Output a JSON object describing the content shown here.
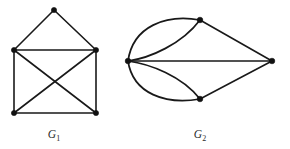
{
  "figure": {
    "background_color": "#ffffff",
    "ink_color": "#191919",
    "vertex_color": "#111111",
    "width": 290,
    "height": 149,
    "caption_color": "#2a2a2a"
  },
  "graphs": [
    {
      "id": "G1",
      "label_base": "G",
      "label_subscript": "1",
      "label_x": 54,
      "label_y": 138,
      "vertex_radius": 2.6,
      "vertex_count": 5,
      "edge_count": 8,
      "vertices": [
        {
          "name": "apex",
          "x": 54,
          "y": 10
        },
        {
          "name": "left",
          "x": 14,
          "y": 50
        },
        {
          "name": "right",
          "x": 96,
          "y": 50
        },
        {
          "name": "bottom-left",
          "x": 14,
          "y": 113
        },
        {
          "name": "bottom-right",
          "x": 96,
          "y": 113
        }
      ],
      "edges": [
        {
          "name": "apex-left",
          "from": "apex",
          "to": "left",
          "path": "M 54 10 L 14 50"
        },
        {
          "name": "apex-right",
          "from": "apex",
          "to": "right",
          "path": "M 54 10 L 96 50"
        },
        {
          "name": "left-right",
          "from": "left",
          "to": "right",
          "path": "M 14 50 L 96 50"
        },
        {
          "name": "left-bottomleft",
          "from": "left",
          "to": "bottom-left",
          "path": "M 14 50 L 14 113"
        },
        {
          "name": "right-bottomright",
          "from": "right",
          "to": "bottom-right",
          "path": "M 96 50 L 96 113"
        },
        {
          "name": "bottomleft-bottomright",
          "from": "bottom-left",
          "to": "bottom-right",
          "path": "M 14 113 L 96 113"
        },
        {
          "name": "left-bottomright",
          "from": "left",
          "to": "bottom-right",
          "path": "M 14 50 L 96 113"
        },
        {
          "name": "right-bottomleft",
          "from": "right",
          "to": "bottom-left",
          "path": "M 96 50 L 14 113"
        }
      ]
    },
    {
      "id": "G2",
      "label_base": "G",
      "label_subscript": "2",
      "label_x": 200,
      "label_y": 138,
      "vertex_radius": 2.8,
      "vertex_count": 4,
      "edge_count": 7,
      "vertices": [
        {
          "name": "left",
          "x": 128,
          "y": 61
        },
        {
          "name": "top",
          "x": 200,
          "y": 20
        },
        {
          "name": "bottom",
          "x": 200,
          "y": 99
        },
        {
          "name": "right",
          "x": 272,
          "y": 61
        }
      ],
      "edges": [
        {
          "name": "left-top-outer",
          "from": "left",
          "to": "top",
          "curved": true,
          "path": "M 128 61 C 133 26, 166 14, 200 20"
        },
        {
          "name": "left-top-inner",
          "from": "left",
          "to": "top",
          "curved": true,
          "path": "M 128 61 C 150 58, 182 44, 200 20"
        },
        {
          "name": "left-bottom-outer",
          "from": "left",
          "to": "bottom",
          "curved": true,
          "path": "M 128 61 C 133 94, 166 105, 200 99"
        },
        {
          "name": "left-bottom-inner",
          "from": "left",
          "to": "bottom",
          "curved": true,
          "path": "M 128 61 C 150 64, 182 76, 200 99"
        },
        {
          "name": "left-right",
          "from": "left",
          "to": "right",
          "curved": false,
          "path": "M 128 61 L 272 61"
        },
        {
          "name": "top-right",
          "from": "top",
          "to": "right",
          "curved": false,
          "path": "M 200 20 L 272 61"
        },
        {
          "name": "bottom-right",
          "from": "bottom",
          "to": "right",
          "curved": false,
          "path": "M 200 99 L 272 61"
        }
      ]
    }
  ]
}
